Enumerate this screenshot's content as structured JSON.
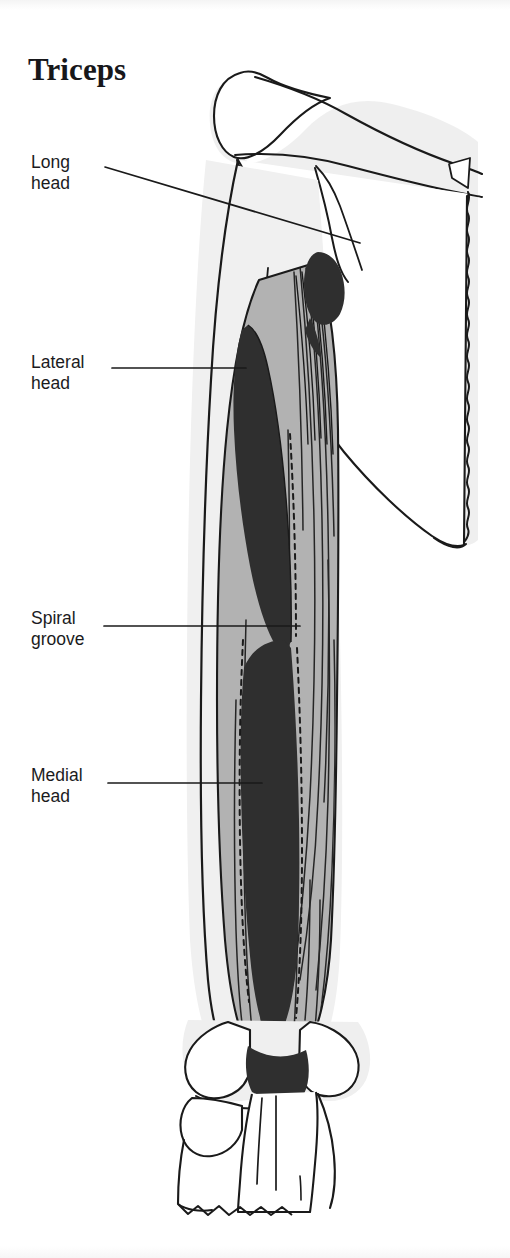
{
  "figure": {
    "title": "Triceps",
    "type": "anatomical-illustration",
    "background_color": "#ffffff"
  },
  "palette": {
    "outline": "#1a1a1a",
    "muscle_gray": "#b2b2b2",
    "attachment_dark": "#2f2f2f",
    "bone_white": "#ffffff",
    "bone_shadow": "#ececec",
    "text": "#1b1b1d"
  },
  "labels": [
    {
      "id": "long-head",
      "text": "Long\nhead",
      "line_from": [
        105,
        168
      ],
      "line_to": [
        358,
        243
      ]
    },
    {
      "id": "lateral-head",
      "text": "Lateral\nhead",
      "line_from": [
        110,
        368
      ],
      "line_to": [
        232,
        368
      ]
    },
    {
      "id": "spiral-groove",
      "text": "Spiral\ngroove",
      "line_from": [
        104,
        625
      ],
      "line_to": [
        270,
        625
      ]
    },
    {
      "id": "medial-head",
      "text": "Medial\nhead",
      "line_from": [
        108,
        782
      ],
      "line_to": [
        238,
        782
      ]
    }
  ],
  "structures": [
    {
      "id": "scapula",
      "name": "scapula",
      "fill": "#ffffff"
    },
    {
      "id": "acromion",
      "name": "acromion process",
      "fill": "#ffffff"
    },
    {
      "id": "humerus",
      "name": "humerus",
      "fill": "#ffffff"
    },
    {
      "id": "long-head-origin",
      "name": "long head origin at infraglenoid tubercle",
      "fill": "#2f2f2f"
    },
    {
      "id": "lateral-head-origin",
      "name": "lateral head origin",
      "fill": "#2f2f2f"
    },
    {
      "id": "medial-head-origin",
      "name": "medial head origin",
      "fill": "#2f2f2f"
    },
    {
      "id": "spiral-groove-band",
      "name": "spiral groove",
      "fill": "#b2b2b2"
    },
    {
      "id": "triceps-belly",
      "name": "triceps muscle belly",
      "fill": "#b2b2b2"
    },
    {
      "id": "olecranon-insertion",
      "name": "olecranon insertion",
      "fill": "#2f2f2f"
    },
    {
      "id": "ulna",
      "name": "ulna",
      "fill": "#ffffff"
    },
    {
      "id": "radius",
      "name": "radius",
      "fill": "#ffffff"
    }
  ]
}
